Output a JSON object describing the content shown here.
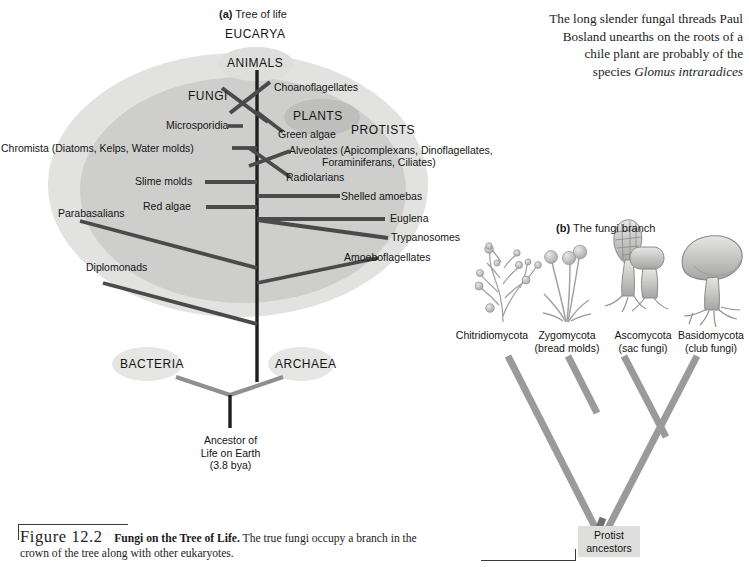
{
  "figure": {
    "panel_a_label": "(a)",
    "panel_a_title": "Tree of life",
    "panel_b_label": "(b)",
    "panel_b_title": "The fungi branch",
    "caption_number": "Figure 12.2",
    "caption_bold": "Fungi on the Tree of Life.",
    "caption_text": " The true fungi occupy a branch in the crown of the tree along with other eukaryotes."
  },
  "blurb": {
    "line1": "The long slender fungal threads Paul",
    "line2": "Bosland unearths on the roots of a",
    "line3": "chile plant are probably of the",
    "line4_plain": "species ",
    "line4_italic": "Glomus intraradices"
  },
  "tree_of_life": {
    "domains": {
      "eucarya": "EUCARYA",
      "bacteria": "BACTERIA",
      "archaea": "ARCHAEA"
    },
    "kingdoms": {
      "animals": "ANIMALS",
      "fungi": "FUNGI",
      "plants": "PLANTS",
      "protists": "PROTISTS"
    },
    "root_label_line1": "Ancestor of",
    "root_label_line2": "Life on Earth",
    "root_label_line3": "(3.8 bya)",
    "branches": [
      {
        "name": "Choanoflagellates"
      },
      {
        "name": "Microsporidia"
      },
      {
        "name": "Green algae"
      },
      {
        "name": "Chromista (Diatoms, Kelps, Water molds)"
      },
      {
        "name": "Alveolates (Apicomplexans, Dinoflagellates,"
      },
      {
        "name": "Foraminiferans, Ciliates)"
      },
      {
        "name": "Slime molds"
      },
      {
        "name": "Radiolarians"
      },
      {
        "name": "Shelled amoebas"
      },
      {
        "name": "Red algae"
      },
      {
        "name": "Euglena"
      },
      {
        "name": "Trypanosomes"
      },
      {
        "name": "Parabasalians"
      },
      {
        "name": "Amoeboflagellates"
      },
      {
        "name": "Diplomonads"
      }
    ]
  },
  "fungi_branch": {
    "taxa": [
      {
        "name": "Chitridiomycota",
        "common": "",
        "icon": "chytrid-illustration"
      },
      {
        "name": "Zygomycota",
        "common": "(bread molds)",
        "icon": "bread-mold-illustration"
      },
      {
        "name": "Ascomycota",
        "common": "(sac fungi)",
        "icon": "sac-fungi-illustration"
      },
      {
        "name": "Basidomycota",
        "common": "(club fungi)",
        "icon": "club-fungi-illustration"
      }
    ],
    "root_line1": "Protist",
    "root_line2": "ancestors"
  },
  "colors": {
    "outer_ellipse": "#e0e0df",
    "inner_ellipse": "#cccccb",
    "kingdom_ellipse": "#bdbdbc",
    "domain_ellipse": "#e4e4e3",
    "branch_line": "#4a4a4a",
    "trunk_line": "#1f1f1f",
    "root_line": "#8f8f8f",
    "fungi_tree": "#9a9a9a"
  }
}
